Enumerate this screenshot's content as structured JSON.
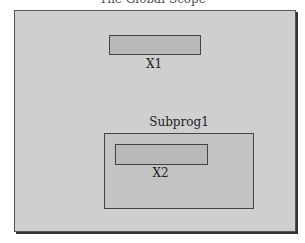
{
  "diagram": {
    "title": "The Global Scope",
    "global_var": {
      "label": "X1"
    },
    "subprogram": {
      "label": "Subprog1",
      "local_var": {
        "label": "X2"
      }
    }
  }
}
